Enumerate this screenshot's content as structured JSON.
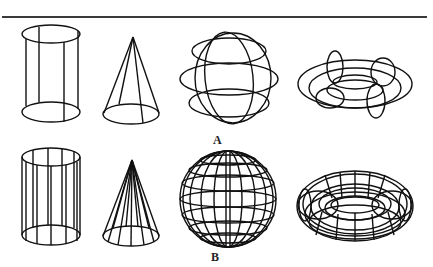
{
  "figure": {
    "rows": [
      {
        "label": "A",
        "density": "coarse",
        "shapes": [
          "cylinder",
          "cone",
          "sphere",
          "torus"
        ]
      },
      {
        "label": "B",
        "density": "fine",
        "shapes": [
          "cylinder",
          "cone",
          "sphere",
          "torus"
        ]
      }
    ],
    "stroke_color": "#111111"
  }
}
